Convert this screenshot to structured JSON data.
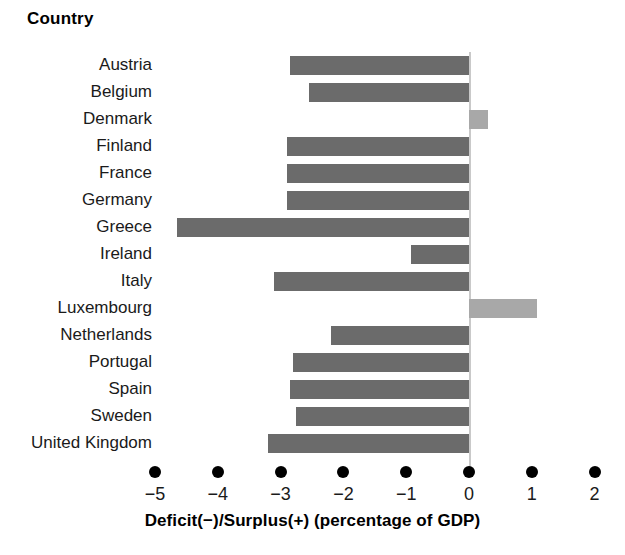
{
  "heading": "Country",
  "chart_data": {
    "type": "bar",
    "orientation": "horizontal",
    "title": "",
    "xlabel": "Deficit(−)/Surplus(+) (percentage of GDP)",
    "ylabel": "Country",
    "xlim": [
      -5.35,
      2.35
    ],
    "xticks": [
      -5,
      -4,
      -3,
      -2,
      -1,
      0,
      1,
      2
    ],
    "xticklabels": [
      "−5",
      "−4",
      "−3",
      "−2",
      "−1",
      "0",
      "1",
      "2"
    ],
    "grid": false,
    "legend": null,
    "tick_marker": "filled-circle",
    "categories": [
      "Austria",
      "Belgium",
      "Denmark",
      "Finland",
      "France",
      "Germany",
      "Greece",
      "Ireland",
      "Italy",
      "Luxembourg",
      "Netherlands",
      "Portugal",
      "Spain",
      "Sweden",
      "United Kingdom"
    ],
    "values": [
      -2.85,
      -2.55,
      0.3,
      -2.9,
      -2.9,
      -2.9,
      -4.65,
      -0.92,
      -3.1,
      1.08,
      -2.2,
      -2.8,
      -2.85,
      -2.75,
      -3.2
    ],
    "colors": {
      "negative": "#6b6b6b",
      "positive": "#a8a8a8",
      "axis_line": "#c9c9c9",
      "text": "#1a1a1a"
    }
  }
}
